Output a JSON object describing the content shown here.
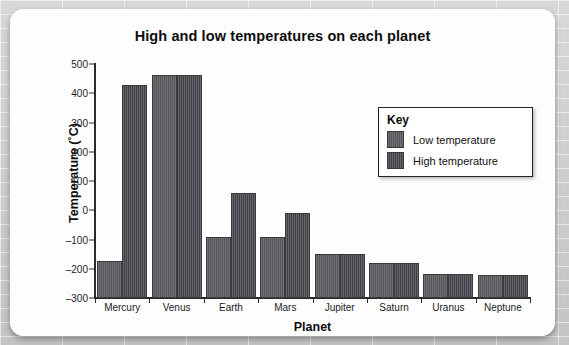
{
  "chart_data": {
    "type": "bar",
    "title": "High and low temperatures on each planet",
    "xlabel": "Planet",
    "ylabel": "Temperature (˚C)",
    "categories": [
      "Mercury",
      "Venus",
      "Earth",
      "Mars",
      "Jupiter",
      "Saturn",
      "Uranus",
      "Neptune"
    ],
    "series": [
      {
        "name": "Low temperature",
        "values": [
          -173,
          462,
          -90,
          -90,
          -150,
          -182,
          -218,
          -222
        ],
        "color": "#55555a"
      },
      {
        "name": "High temperature",
        "values": [
          427,
          462,
          58,
          -10,
          -150,
          -182,
          -218,
          -222
        ],
        "color": "#3f3f45"
      }
    ],
    "ylim": [
      -300,
      500
    ],
    "yticks": [
      500,
      400,
      300,
      200,
      100,
      0,
      -100,
      -200,
      -300
    ],
    "ytick_labels": [
      "500",
      "400",
      "300",
      "200",
      "100",
      "0",
      "–100",
      "–200",
      "–300"
    ],
    "grid": false,
    "legend_position": "inside-top-right"
  },
  "legend": {
    "title": "Key",
    "entries": [
      {
        "label": "Low temperature"
      },
      {
        "label": "High temperature"
      }
    ]
  }
}
